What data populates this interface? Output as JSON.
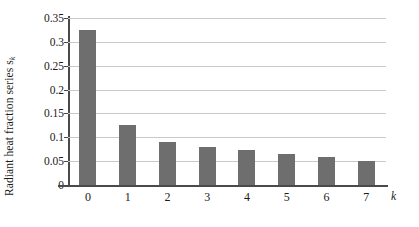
{
  "chart_data": {
    "type": "bar",
    "title": "",
    "subtitle": "",
    "xlabel": "k",
    "ylabel": "Radiant heat fraction series s",
    "ylabel_subscript": "k",
    "categories": [
      "0",
      "1",
      "2",
      "3",
      "4",
      "5",
      "6",
      "7"
    ],
    "values": [
      0.325,
      0.125,
      0.091,
      0.08,
      0.074,
      0.065,
      0.059,
      0.05
    ],
    "series": [
      {
        "name": "Radiant heat fraction series",
        "values": [
          0.325,
          0.125,
          0.091,
          0.08,
          0.074,
          0.065,
          0.059,
          0.05
        ]
      }
    ],
    "ylim": [
      0,
      0.35
    ],
    "yticks": [
      0,
      0.05,
      0.1,
      0.15,
      0.2,
      0.25,
      0.3,
      0.35
    ],
    "ytick_labels": [
      "0",
      "0.05",
      "0.1",
      "0.15",
      "0.2",
      "0.25",
      "0.3",
      "0.35"
    ],
    "xtick_labels": [
      "0",
      "1",
      "2",
      "3",
      "4",
      "5",
      "6",
      "7"
    ],
    "grid": "horizontal",
    "legend": "none",
    "legend_position": "none",
    "bar_color": "#6e6e6e",
    "grid_color": "#c9c9c9",
    "axis_color": "#4a4a4a",
    "background_color": "#ffffff",
    "text_color": "#1a1a1a"
  }
}
